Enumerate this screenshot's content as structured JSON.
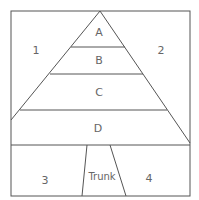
{
  "diagram": {
    "regions": {
      "a": "A",
      "b": "B",
      "c": "C",
      "d": "D",
      "left_top": "1",
      "right_top": "2",
      "left_bottom": "3",
      "right_bottom": "4",
      "trunk": "Trunk"
    },
    "colors": {
      "line": "#555555",
      "text": "#666666"
    }
  }
}
